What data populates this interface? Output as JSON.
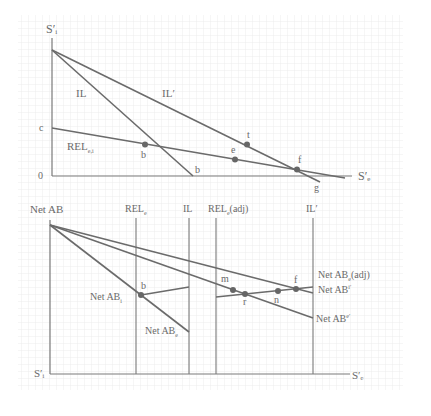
{
  "colors": {
    "line": "#6b6b6b",
    "grid": "#e6e6e6",
    "text": "#6a6a6a"
  },
  "upper_panel": {
    "y_axis_label": "S′ᵢ",
    "x_axis_label": "S′ₑ",
    "origin_label": "0",
    "intercept_label": "c",
    "curves": {
      "il": "IL",
      "il_prime": "IL′",
      "rel": "REL",
      "rel_sub": "e,i"
    },
    "points": {
      "b": "b",
      "b_axis": "b",
      "e": "e",
      "t": "t",
      "f": "f",
      "g": "g"
    }
  },
  "lower_panel": {
    "y_axis_label": "Net AB",
    "origin_label": "S′ᵢ",
    "x_axis_label": "S′ₑ",
    "vertical_lines": {
      "rel": "REL",
      "rel_sub": "e",
      "il": "IL",
      "rel_adj": "REL",
      "rel_adj_sub": "e",
      "rel_adj_suffix": "(adj)",
      "il_prime": "IL′"
    },
    "curves": {
      "net_ab_adj": "Net AB",
      "net_ab_adj_sub": "e",
      "net_ab_adj_suffix": "(adj)",
      "net_ab_i_prime": "Net AB",
      "net_ab_i_prime_sub": "i′",
      "net_ab_e_prime": "Net AB",
      "net_ab_e_prime_sub": "e′",
      "net_ab_i": "Net AB",
      "net_ab_i_sub": "i",
      "net_ab_e": "Net AB",
      "net_ab_e_sub": "e"
    },
    "points": {
      "b": "b",
      "m": "m",
      "r": "r",
      "n": "n",
      "f": "f"
    }
  }
}
